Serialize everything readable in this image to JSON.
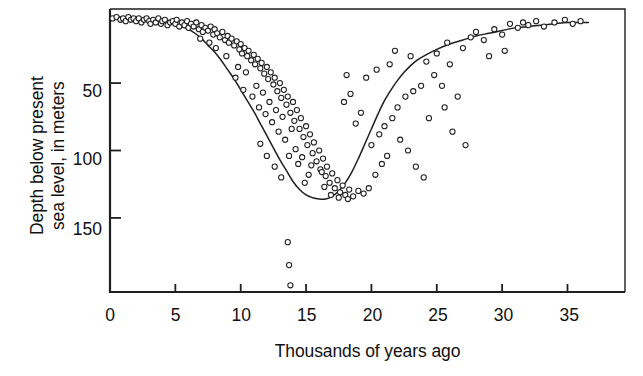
{
  "chart_data": {
    "type": "scatter",
    "title": "",
    "xlabel": "Thousands of years ago",
    "ylabel": "Depth below present\nsea level, in meters",
    "xlim": [
      0,
      39.4
    ],
    "ylim": [
      205,
      -5
    ],
    "y_inverted": true,
    "grid": false,
    "legend": null,
    "xticks": [
      0,
      5,
      10,
      15,
      20,
      25,
      30,
      35
    ],
    "xtick_labels": [
      "0",
      "5",
      "10",
      "15",
      "20",
      "25",
      "30",
      "35"
    ],
    "yticks": [
      50,
      100,
      150
    ],
    "ytick_labels": [
      "50",
      "100",
      "150"
    ],
    "marker": "open-circle",
    "marker_color": "#1f1f1f",
    "marker_fill": "#ffffff",
    "curve_color": "#1f1f1f",
    "axis_color": "#1f1f1f",
    "series": [
      {
        "name": "Sea level index points",
        "type": "scatter",
        "points": [
          [
            0.2,
            2
          ],
          [
            0.5,
            1
          ],
          [
            0.8,
            3
          ],
          [
            1.0,
            2
          ],
          [
            1.2,
            4
          ],
          [
            1.4,
            1
          ],
          [
            1.6,
            3
          ],
          [
            1.8,
            2
          ],
          [
            2.0,
            4
          ],
          [
            2.2,
            2
          ],
          [
            2.4,
            5
          ],
          [
            2.6,
            3
          ],
          [
            2.8,
            2
          ],
          [
            3.0,
            4
          ],
          [
            3.1,
            6
          ],
          [
            3.3,
            3
          ],
          [
            3.5,
            5
          ],
          [
            3.7,
            2
          ],
          [
            3.9,
            6
          ],
          [
            4.0,
            4
          ],
          [
            4.2,
            3
          ],
          [
            4.4,
            7
          ],
          [
            4.6,
            5
          ],
          [
            4.8,
            4
          ],
          [
            5.0,
            6
          ],
          [
            5.1,
            3
          ],
          [
            5.3,
            8
          ],
          [
            5.5,
            5
          ],
          [
            5.7,
            7
          ],
          [
            5.9,
            4
          ],
          [
            6.0,
            9
          ],
          [
            6.2,
            6
          ],
          [
            6.4,
            8
          ],
          [
            6.6,
            5
          ],
          [
            6.8,
            10
          ],
          [
            7.0,
            7
          ],
          [
            7.1,
            12
          ],
          [
            7.3,
            9
          ],
          [
            7.5,
            11
          ],
          [
            7.7,
            8
          ],
          [
            7.9,
            14
          ],
          [
            8.0,
            10
          ],
          [
            8.2,
            13
          ],
          [
            8.4,
            16
          ],
          [
            8.6,
            12
          ],
          [
            8.8,
            18
          ],
          [
            9.0,
            15
          ],
          [
            9.1,
            20
          ],
          [
            9.3,
            17
          ],
          [
            9.5,
            22
          ],
          [
            9.7,
            19
          ],
          [
            9.9,
            25
          ],
          [
            10.0,
            21
          ],
          [
            10.1,
            28
          ],
          [
            10.3,
            24
          ],
          [
            10.5,
            30
          ],
          [
            10.6,
            26
          ],
          [
            10.8,
            33
          ],
          [
            11.0,
            29
          ],
          [
            11.1,
            36
          ],
          [
            11.3,
            32
          ],
          [
            11.5,
            39
          ],
          [
            11.6,
            35
          ],
          [
            11.8,
            43
          ],
          [
            12.0,
            38
          ],
          [
            12.1,
            47
          ],
          [
            12.3,
            42
          ],
          [
            12.5,
            51
          ],
          [
            12.6,
            46
          ],
          [
            12.8,
            56
          ],
          [
            13.0,
            50
          ],
          [
            13.1,
            61
          ],
          [
            13.3,
            55
          ],
          [
            13.5,
            66
          ],
          [
            13.6,
            60
          ],
          [
            13.8,
            72
          ],
          [
            14.0,
            64
          ],
          [
            14.1,
            78
          ],
          [
            14.3,
            70
          ],
          [
            14.5,
            84
          ],
          [
            14.6,
            76
          ],
          [
            14.8,
            90
          ],
          [
            15.0,
            82
          ],
          [
            15.1,
            96
          ],
          [
            15.3,
            88
          ],
          [
            15.5,
            102
          ],
          [
            15.6,
            94
          ],
          [
            15.8,
            108
          ],
          [
            16.0,
            100
          ],
          [
            16.1,
            114
          ],
          [
            16.3,
            106
          ],
          [
            16.5,
            119
          ],
          [
            16.6,
            112
          ],
          [
            16.8,
            124
          ],
          [
            17.0,
            117
          ],
          [
            17.2,
            128
          ],
          [
            17.4,
            122
          ],
          [
            17.6,
            131
          ],
          [
            17.8,
            126
          ],
          [
            18.0,
            133
          ],
          [
            18.3,
            129
          ],
          [
            18.6,
            134
          ],
          [
            19.0,
            130
          ],
          [
            19.4,
            132
          ],
          [
            9.6,
            46
          ],
          [
            10.2,
            55
          ],
          [
            10.9,
            60
          ],
          [
            11.4,
            68
          ],
          [
            11.9,
            73
          ],
          [
            12.4,
            79
          ],
          [
            12.9,
            86
          ],
          [
            13.4,
            92
          ],
          [
            10.4,
            42
          ],
          [
            11.2,
            52
          ],
          [
            12.2,
            64
          ],
          [
            13.2,
            75
          ],
          [
            14.2,
            99
          ],
          [
            14.7,
            105
          ],
          [
            15.4,
            111
          ],
          [
            16.2,
            116
          ],
          [
            13.7,
            104
          ],
          [
            14.4,
            110
          ],
          [
            15.2,
            118
          ],
          [
            16.4,
            127
          ],
          [
            12.7,
            70
          ],
          [
            13.9,
            84
          ],
          [
            11.7,
            57
          ],
          [
            9.8,
            38
          ],
          [
            8.9,
            30
          ],
          [
            8.1,
            24
          ],
          [
            7.6,
            20
          ],
          [
            6.9,
            17
          ],
          [
            13.6,
            168
          ],
          [
            13.7,
            185
          ],
          [
            13.8,
            200
          ],
          [
            11.5,
            95
          ],
          [
            12.0,
            104
          ],
          [
            12.6,
            112
          ],
          [
            13.1,
            120
          ],
          [
            14.9,
            124
          ],
          [
            16.9,
            133
          ],
          [
            17.5,
            135
          ],
          [
            18.2,
            136
          ],
          [
            19.8,
            128
          ],
          [
            20.3,
            118
          ],
          [
            20.8,
            110
          ],
          [
            21.2,
            104
          ],
          [
            18.8,
            80
          ],
          [
            19.2,
            72
          ],
          [
            17.9,
            64
          ],
          [
            18.4,
            58
          ],
          [
            20.0,
            96
          ],
          [
            20.6,
            88
          ],
          [
            21.0,
            82
          ],
          [
            21.6,
            76
          ],
          [
            22.0,
            68
          ],
          [
            22.6,
            60
          ],
          [
            23.2,
            56
          ],
          [
            23.8,
            52
          ],
          [
            19.6,
            46
          ],
          [
            20.4,
            40
          ],
          [
            21.4,
            36
          ],
          [
            18.1,
            44
          ],
          [
            22.2,
            92
          ],
          [
            22.8,
            100
          ],
          [
            23.4,
            112
          ],
          [
            24.0,
            120
          ],
          [
            24.8,
            44
          ],
          [
            25.4,
            52
          ],
          [
            26.0,
            36
          ],
          [
            26.6,
            60
          ],
          [
            25.0,
            28
          ],
          [
            25.8,
            20
          ],
          [
            27.0,
            24
          ],
          [
            27.6,
            16
          ],
          [
            26.2,
            86
          ],
          [
            27.2,
            96
          ],
          [
            24.4,
            76
          ],
          [
            25.6,
            68
          ],
          [
            28.0,
            12
          ],
          [
            28.6,
            18
          ],
          [
            29.4,
            10
          ],
          [
            30.0,
            14
          ],
          [
            30.6,
            6
          ],
          [
            31.2,
            9
          ],
          [
            31.6,
            5
          ],
          [
            32.0,
            7
          ],
          [
            32.6,
            4
          ],
          [
            33.2,
            8
          ],
          [
            34.0,
            5
          ],
          [
            34.8,
            3
          ],
          [
            35.4,
            6
          ],
          [
            36.0,
            4
          ],
          [
            29.0,
            30
          ],
          [
            30.2,
            26
          ],
          [
            24.2,
            34
          ],
          [
            23.0,
            30
          ],
          [
            21.8,
            26
          ]
        ]
      },
      {
        "name": "Fitted sea-level curve",
        "type": "line",
        "points": [
          [
            0.0,
            1
          ],
          [
            1.0,
            1
          ],
          [
            2.0,
            2
          ],
          [
            3.0,
            3
          ],
          [
            4.0,
            4
          ],
          [
            5.0,
            6
          ],
          [
            5.5,
            8
          ],
          [
            6.0,
            10
          ],
          [
            6.5,
            13
          ],
          [
            7.0,
            17
          ],
          [
            7.5,
            22
          ],
          [
            8.0,
            27
          ],
          [
            8.5,
            33
          ],
          [
            9.0,
            40
          ],
          [
            9.5,
            47
          ],
          [
            10.0,
            55
          ],
          [
            10.5,
            63
          ],
          [
            11.0,
            71
          ],
          [
            11.5,
            80
          ],
          [
            12.0,
            89
          ],
          [
            12.5,
            98
          ],
          [
            13.0,
            107
          ],
          [
            13.5,
            115
          ],
          [
            14.0,
            123
          ],
          [
            14.5,
            129
          ],
          [
            15.0,
            133
          ],
          [
            15.5,
            135
          ],
          [
            16.0,
            136
          ],
          [
            16.5,
            136
          ],
          [
            17.0,
            134
          ],
          [
            17.5,
            130
          ],
          [
            18.0,
            124
          ],
          [
            18.5,
            116
          ],
          [
            19.0,
            106
          ],
          [
            19.5,
            95
          ],
          [
            20.0,
            84
          ],
          [
            20.5,
            73
          ],
          [
            21.0,
            63
          ],
          [
            21.5,
            55
          ],
          [
            22.0,
            48
          ],
          [
            22.5,
            42
          ],
          [
            23.0,
            37
          ],
          [
            23.5,
            33
          ],
          [
            24.0,
            30
          ],
          [
            25.0,
            25
          ],
          [
            26.0,
            21
          ],
          [
            27.0,
            18
          ],
          [
            28.0,
            15
          ],
          [
            29.0,
            13
          ],
          [
            30.0,
            11
          ],
          [
            31.0,
            9
          ],
          [
            32.0,
            8
          ],
          [
            33.0,
            7
          ],
          [
            34.0,
            6
          ],
          [
            35.0,
            5
          ],
          [
            36.0,
            5
          ],
          [
            36.6,
            5
          ]
        ]
      }
    ]
  }
}
